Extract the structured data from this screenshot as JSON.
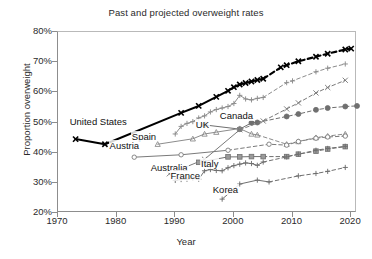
{
  "chart_data": {
    "type": "line",
    "title": "Past and projected overweight rates",
    "xlabel": "Year",
    "ylabel": "Proportion overweight",
    "xlim": [
      1970,
      2021
    ],
    "ylim": [
      0.2,
      0.8
    ],
    "xticks": [
      "1970",
      "1980",
      "1990",
      "2000",
      "2010",
      "2020"
    ],
    "xtick_values": [
      1970,
      1980,
      1990,
      2000,
      2010,
      2020
    ],
    "yticks": [
      "20%",
      "30%",
      "40%",
      "50%",
      "60%",
      "70%",
      "80%"
    ],
    "ytick_values": [
      0.2,
      0.3,
      0.4,
      0.5,
      0.6,
      0.7,
      0.8
    ],
    "grid": false,
    "legend_position": "inline-annotations",
    "note": "Solid segments are observed data; dashed segments are projections.",
    "series": [
      {
        "name": "United States",
        "marker": "x",
        "color": "#000000",
        "linewidth": 2.1,
        "observed": [
          [
            1973,
            0.445
          ],
          [
            1978,
            0.428
          ],
          [
            1991,
            0.532
          ],
          [
            1994,
            0.555
          ],
          [
            1997,
            0.585
          ],
          [
            1999,
            0.605
          ],
          [
            2000,
            0.617
          ],
          [
            2001,
            0.626
          ],
          [
            2002,
            0.631
          ],
          [
            2003,
            0.636
          ],
          [
            2004,
            0.641
          ],
          [
            2005,
            0.645
          ]
        ],
        "projected": [
          [
            2005,
            0.645
          ],
          [
            2008,
            0.683
          ],
          [
            2009,
            0.69
          ],
          [
            2011,
            0.703
          ],
          [
            2014,
            0.718
          ],
          [
            2016,
            0.728
          ],
          [
            2019,
            0.742
          ],
          [
            2020,
            0.745
          ]
        ]
      },
      {
        "name": "UK",
        "marker": "+",
        "color": "#8c8c8c",
        "linewidth": 1.0,
        "observed": [
          [
            1990,
            0.462
          ],
          [
            1991,
            0.487
          ],
          [
            1992,
            0.497
          ],
          [
            1993,
            0.503
          ],
          [
            1994,
            0.515
          ],
          [
            1995,
            0.522
          ],
          [
            1996,
            0.535
          ],
          [
            1997,
            0.543
          ],
          [
            1998,
            0.548
          ],
          [
            1999,
            0.553
          ],
          [
            2000,
            0.563
          ],
          [
            2001,
            0.59
          ],
          [
            2002,
            0.578
          ],
          [
            2003,
            0.575
          ],
          [
            2004,
            0.58
          ],
          [
            2005,
            0.583
          ]
        ],
        "projected": [
          [
            2005,
            0.583
          ],
          [
            2009,
            0.632
          ],
          [
            2010,
            0.638
          ],
          [
            2014,
            0.668
          ],
          [
            2016,
            0.68
          ],
          [
            2019,
            0.694
          ]
        ]
      },
      {
        "name": "Canada",
        "marker": "o-filled",
        "color": "#6f6f6f",
        "linewidth": 1.0,
        "observed": [
          [
            1995,
            0.492
          ],
          [
            2001,
            0.478
          ],
          [
            2003,
            0.499
          ],
          [
            2004,
            0.5
          ]
        ],
        "projected": [
          [
            2004,
            0.5
          ],
          [
            2009,
            0.52
          ],
          [
            2011,
            0.528
          ],
          [
            2014,
            0.542
          ],
          [
            2016,
            0.548
          ],
          [
            2019,
            0.553
          ],
          [
            2021,
            0.555
          ]
        ]
      },
      {
        "name": "Spain",
        "marker": "triangle",
        "color": "#8c8c8c",
        "linewidth": 1.0,
        "observed": [
          [
            1987,
            0.428
          ],
          [
            1993,
            0.446
          ],
          [
            1995,
            0.462
          ],
          [
            1997,
            0.468
          ],
          [
            2001,
            0.48
          ],
          [
            2003,
            0.462
          ],
          [
            2004,
            0.459
          ]
        ],
        "projected": [
          [
            2004,
            0.459
          ],
          [
            2009,
            0.428
          ],
          [
            2011,
            0.437
          ],
          [
            2014,
            0.45
          ],
          [
            2016,
            0.455
          ],
          [
            2019,
            0.462
          ]
        ]
      },
      {
        "name": "Austria",
        "marker": "o-open",
        "color": "#7a7a7a",
        "linewidth": 1.0,
        "observed": [
          [
            1983,
            0.385
          ],
          [
            1991,
            0.393
          ],
          [
            1999,
            0.408
          ]
        ],
        "projected": [
          [
            1999,
            0.408
          ],
          [
            2006,
            0.428
          ],
          [
            2009,
            0.425
          ],
          [
            2011,
            0.437
          ],
          [
            2014,
            0.448
          ],
          [
            2016,
            0.452
          ],
          [
            2019,
            0.455
          ]
        ]
      },
      {
        "name": "Australia",
        "marker": "x",
        "color": "#7a7a7a",
        "linewidth": 1.0,
        "observed": [
          [
            1989,
            0.33
          ],
          [
            1995,
            0.378
          ],
          [
            2001,
            0.476
          ]
        ],
        "projected": [
          [
            2001,
            0.476
          ],
          [
            2005,
            0.505
          ],
          [
            2009,
            0.545
          ],
          [
            2011,
            0.565
          ],
          [
            2014,
            0.598
          ],
          [
            2016,
            0.616
          ],
          [
            2019,
            0.64
          ]
        ]
      },
      {
        "name": "Italy",
        "marker": "square",
        "color": "#6f6f6f",
        "linewidth": 1.0,
        "observed": [
          [
            1994,
            0.368
          ],
          [
            1999,
            0.386
          ],
          [
            2001,
            0.386
          ],
          [
            2003,
            0.387
          ],
          [
            2005,
            0.387
          ]
        ],
        "projected": [
          [
            2005,
            0.387
          ],
          [
            2009,
            0.387
          ],
          [
            2011,
            0.395
          ],
          [
            2014,
            0.405
          ],
          [
            2016,
            0.412
          ],
          [
            2019,
            0.42
          ]
        ]
      },
      {
        "name": "France",
        "marker": "+",
        "color": "#6f6f6f",
        "linewidth": 1.0,
        "observed": [
          [
            1990,
            0.308
          ],
          [
            1991,
            0.311
          ],
          [
            1992,
            0.312
          ],
          [
            1993,
            0.315
          ],
          [
            1994,
            0.312
          ],
          [
            1995,
            0.34
          ],
          [
            1996,
            0.344
          ],
          [
            1997,
            0.341
          ],
          [
            1998,
            0.34
          ],
          [
            1999,
            0.35
          ],
          [
            2000,
            0.357
          ],
          [
            2001,
            0.362
          ],
          [
            2002,
            0.366
          ],
          [
            2003,
            0.364
          ],
          [
            2004,
            0.358
          ],
          [
            2005,
            0.369
          ]
        ],
        "projected": [
          [
            2005,
            0.369
          ],
          [
            2009,
            0.386
          ],
          [
            2011,
            0.395
          ],
          [
            2014,
            0.408
          ],
          [
            2016,
            0.414
          ],
          [
            2019,
            0.421
          ]
        ]
      },
      {
        "name": "Korea",
        "marker": "+",
        "color": "#6f6f6f",
        "linewidth": 1.0,
        "observed": [
          [
            1998,
            0.246
          ],
          [
            2001,
            0.296
          ],
          [
            2004,
            0.309
          ],
          [
            2006,
            0.303
          ]
        ],
        "projected": [
          [
            2006,
            0.303
          ],
          [
            2011,
            0.323
          ],
          [
            2014,
            0.331
          ],
          [
            2016,
            0.338
          ],
          [
            2019,
            0.351
          ]
        ]
      }
    ],
    "annotations": [
      {
        "text": "United States",
        "x": 1972.0,
        "y": 0.497,
        "anchor": "start"
      },
      {
        "text": "UK",
        "x": 1993.5,
        "y": 0.487,
        "anchor": "start"
      },
      {
        "text": "Canada",
        "x": 1997.6,
        "y": 0.517,
        "anchor": "start"
      },
      {
        "text": "Spain",
        "x": 1982.6,
        "y": 0.447,
        "anchor": "start"
      },
      {
        "text": "Austria",
        "x": 1978.8,
        "y": 0.418,
        "anchor": "start"
      },
      {
        "text": "Australia",
        "x": 1985.8,
        "y": 0.346,
        "anchor": "start"
      },
      {
        "text": "Italy",
        "x": 1994.4,
        "y": 0.358,
        "anchor": "start"
      },
      {
        "text": "France",
        "x": 1989.2,
        "y": 0.318,
        "anchor": "start"
      },
      {
        "text": "Korea",
        "x": 1996.4,
        "y": 0.272,
        "anchor": "start"
      }
    ]
  }
}
